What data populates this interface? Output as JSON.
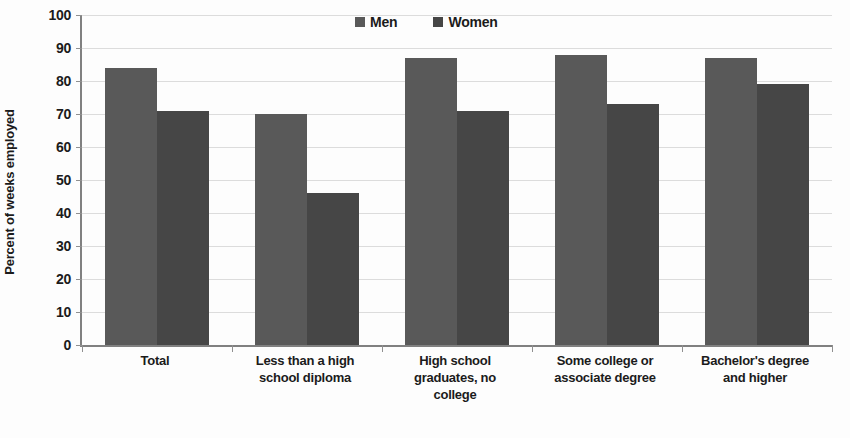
{
  "chart": {
    "type": "bar",
    "y_axis_title": "Percent of weeks employed",
    "legend": {
      "men_label": "Men",
      "women_label": "Women",
      "men_color": "#595959",
      "women_color": "#464646",
      "position": "top-center"
    }
  },
  "chart_data": {
    "type": "bar",
    "title": "",
    "xlabel": "",
    "ylabel": "Percent of weeks employed",
    "ylim": [
      0,
      100
    ],
    "ytick_step": 10,
    "yticks": [
      0,
      10,
      20,
      30,
      40,
      50,
      60,
      70,
      80,
      90,
      100
    ],
    "ytick_labels": [
      "0",
      "10",
      "20",
      "30",
      "40",
      "50",
      "60",
      "70",
      "80",
      "90",
      "100"
    ],
    "grid": true,
    "legend_position": "top-center",
    "categories": [
      "Total",
      "Less than a high school diploma",
      "High school graduates, no college",
      "Some college or associate degree",
      "Bachelor's degree and higher"
    ],
    "category_label_lines": [
      [
        "Total"
      ],
      [
        "Less than a high",
        "school diploma"
      ],
      [
        "High school",
        "graduates, no",
        "college"
      ],
      [
        "Some college or",
        "associate degree"
      ],
      [
        "Bachelor's degree",
        "and higher"
      ]
    ],
    "series": [
      {
        "name": "Men",
        "color": "#595959",
        "values": [
          84,
          70,
          87,
          88,
          87
        ]
      },
      {
        "name": "Women",
        "color": "#464646",
        "values": [
          71,
          46,
          71,
          73,
          79
        ]
      }
    ]
  }
}
